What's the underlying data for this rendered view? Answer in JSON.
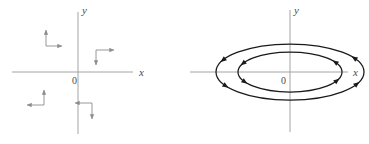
{
  "figure": {
    "background_color": "#ffffff",
    "axis_color_left": "#9a9a9a",
    "axis_color_right": "#9a9a9a",
    "curve_color": "#1a1a1a",
    "arrow_color_left": "#8c8c8c",
    "label_color": "#4a4a4a"
  },
  "panels": [
    {
      "id": "vector-field-panel",
      "type": "vector-field",
      "axes": {
        "x_label": "x",
        "y_label": "y",
        "origin_label": "0",
        "x_axis": {
          "x1": 12,
          "y1": 72,
          "x2": 133,
          "y2": 72
        },
        "y_axis": {
          "x1": 78,
          "y1": 12,
          "x2": 78,
          "y2": 134
        },
        "origin": {
          "x": 78,
          "y": 72
        }
      },
      "arrow_pairs": [
        {
          "quadrant": "top-left",
          "corner": {
            "x": 46,
            "y": 46
          },
          "vertical": {
            "direction": "up",
            "length": 18
          },
          "horizontal": {
            "direction": "right",
            "length": 18
          }
        },
        {
          "quadrant": "top-right",
          "corner": {
            "x": 96,
            "y": 50
          },
          "vertical": {
            "direction": "down",
            "length": 17
          },
          "horizontal": {
            "direction": "right",
            "length": 20
          }
        },
        {
          "quadrant": "bottom-left",
          "corner": {
            "x": 44,
            "y": 105
          },
          "vertical": {
            "direction": "up",
            "length": 17
          },
          "horizontal": {
            "direction": "left",
            "length": 18
          }
        },
        {
          "quadrant": "bottom-right",
          "corner": {
            "x": 92,
            "y": 103
          },
          "vertical": {
            "direction": "down",
            "length": 18
          },
          "horizontal": {
            "direction": "left",
            "length": 18
          }
        }
      ]
    },
    {
      "id": "phase-portrait-panel",
      "type": "closed-orbits",
      "axes": {
        "x_label": "x",
        "y_label": "y",
        "origin_label": "0",
        "x_axis": {
          "x1": 5,
          "y1": 72,
          "x2": 163,
          "y2": 72
        },
        "y_axis": {
          "x1": 105,
          "y1": 10,
          "x2": 105,
          "y2": 132
        },
        "origin": {
          "x": 105,
          "y": 72
        }
      },
      "orbits": [
        {
          "name": "outer-ellipse",
          "cx": 105,
          "cy": 72,
          "rx": 74,
          "ry": 28,
          "direction": "clockwise"
        },
        {
          "name": "inner-ellipse",
          "cx": 105,
          "cy": 72,
          "rx": 52,
          "ry": 20,
          "direction": "clockwise"
        }
      ],
      "orbit_arrow_angles_deg": [
        205,
        330,
        25,
        150
      ]
    }
  ]
}
